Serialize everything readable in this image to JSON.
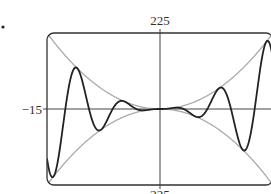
{
  "chart_data": {
    "type": "line",
    "title": "",
    "xlabel": "",
    "ylabel": "",
    "xlim": [
      -15,
      15
    ],
    "ylim": [
      -225,
      225
    ],
    "grid": false,
    "tick_labels": {
      "y_top": "225",
      "y_bottom": "−225",
      "x_left": "−15"
    },
    "series": [
      {
        "name": "f(x) = x^2 sin x",
        "expression": "x^2*sin(x)",
        "color": "#222222",
        "style": "solid"
      },
      {
        "name": "y = x^2",
        "expression": "x^2",
        "color": "#aaaaaa",
        "style": "solid"
      },
      {
        "name": "y = -x^2",
        "expression": "-x^2",
        "color": "#aaaaaa",
        "style": "solid"
      }
    ],
    "samples": {
      "x": [
        -15,
        -14.1,
        -11,
        -7.9,
        -4.9,
        0,
        4.9,
        7.9,
        11,
        14.1,
        15
      ],
      "f": [
        -147.9,
        -199.0,
        121.0,
        -62.4,
        23.6,
        0,
        -23.6,
        62.4,
        -121.0,
        199.0,
        147.9
      ]
    }
  },
  "labels": {
    "top": "225",
    "bottom": "225",
    "left": "−15"
  },
  "marker": "•"
}
